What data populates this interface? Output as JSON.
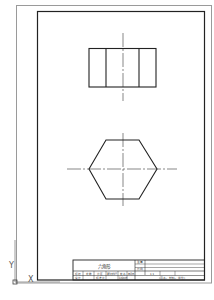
{
  "drawing": {
    "part_name": "六角形",
    "ucs": {
      "x_label": "X",
      "y_label": "Y"
    },
    "colors": {
      "background": "#ffffff",
      "frame": "#222222",
      "sheet_border": "#9a9a9a",
      "centerline": "#555555",
      "geometry": "#222222"
    }
  },
  "title_block": {
    "name_cell": "六角形",
    "row_labels_right_top": [
      "重量",
      "比例"
    ],
    "revision_row": [
      "标记",
      "处数",
      "分区",
      "更改文件号",
      "签名",
      "年月日"
    ],
    "design_row": [
      "设计",
      "标准化",
      "阶段标记",
      "重量",
      "比例"
    ],
    "scale_value": "1:1",
    "bottom_right_note": "(图名、材料、单位)"
  }
}
